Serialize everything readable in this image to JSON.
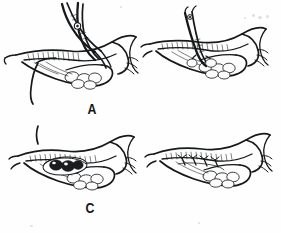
{
  "figure": {
    "kind": "medical-line-illustration",
    "title": "",
    "caption": "",
    "background_color": "#fefefe",
    "ink_color": "#16181a",
    "panel_count": 4,
    "layout": "2x2 grid",
    "panels": [
      {
        "id": "A",
        "label": "A",
        "position": "top-left",
        "description": "Gallbladder and cystic duct grasped with curved hemostat/scissors; suture thread trailing to lower left",
        "instrument": "curved-hemostat",
        "instrument_detail": "two-limb curved clamp with pivot rivet",
        "has_suture_thread": true,
        "stone_count": 0
      },
      {
        "id": "B",
        "label": "B",
        "position": "top-right",
        "description": "Straight scissors incising the anterior wall of the gallbladder fundus",
        "instrument": "straight-scissors",
        "instrument_detail": "straight blade with pivot rivet and open tips",
        "has_suture_thread": false,
        "stone_count": 0
      },
      {
        "id": "C",
        "label": "C",
        "position": "bottom-left",
        "description": "Opened gallbladder with dark calculi exposed through the incision; no instrument",
        "instrument": "none",
        "instrument_detail": "",
        "has_suture_thread": false,
        "stone_count": 3
      },
      {
        "id": "D",
        "label": "D",
        "position": "bottom-right",
        "description": "Incision closed with four interrupted sutures; no instrument",
        "instrument": "none",
        "instrument_detail": "",
        "has_suture_thread": false,
        "suture_count": 4
      }
    ],
    "labels": {
      "a": "A",
      "b": "B",
      "c": "C",
      "d": "D"
    }
  }
}
